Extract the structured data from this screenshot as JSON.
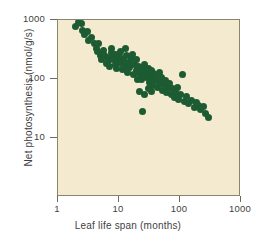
{
  "chart_data": {
    "type": "scatter",
    "title": "",
    "xlabel": "Leaf life span (months)",
    "ylabel": "Net photosynthesis (nmol/g/s)",
    "xscale": "log",
    "yscale": "log",
    "xlim": [
      1,
      1000
    ],
    "ylim": [
      1,
      1000
    ],
    "xticks": [
      1,
      10,
      100,
      1000
    ],
    "xtick_labels": [
      "1",
      "10",
      "100",
      "1000"
    ],
    "yticks": [
      10,
      100,
      1000
    ],
    "ytick_labels": [
      "10",
      "100",
      "1000"
    ],
    "grid": false,
    "legend": null,
    "marker_color": "#1d5b32",
    "plot_background_color": "#f4ead0",
    "frame_color": "#8a8470",
    "series": [
      {
        "name": "Leaf species",
        "points": [
          [
            1.9,
            790
          ],
          [
            2.2,
            900
          ],
          [
            2.45,
            870
          ],
          [
            2.5,
            660
          ],
          [
            2.7,
            560
          ],
          [
            3.0,
            640
          ],
          [
            3.2,
            455
          ],
          [
            3.6,
            500
          ],
          [
            3.9,
            400
          ],
          [
            4.2,
            330
          ],
          [
            4.5,
            290
          ],
          [
            4.6,
            395
          ],
          [
            5.0,
            255
          ],
          [
            5.2,
            215
          ],
          [
            5.6,
            300
          ],
          [
            5.8,
            250
          ],
          [
            6.2,
            180
          ],
          [
            6.4,
            235
          ],
          [
            6.8,
            205
          ],
          [
            7.0,
            160
          ],
          [
            7.4,
            330
          ],
          [
            7.6,
            280
          ],
          [
            7.9,
            250
          ],
          [
            8.2,
            215
          ],
          [
            8.6,
            175
          ],
          [
            8.8,
            265
          ],
          [
            9.2,
            150
          ],
          [
            9.5,
            205
          ],
          [
            10.0,
            240
          ],
          [
            10.5,
            290
          ],
          [
            11.0,
            185
          ],
          [
            11.5,
            145
          ],
          [
            12.0,
            215
          ],
          [
            12.5,
            165
          ],
          [
            13.0,
            330
          ],
          [
            13.5,
            250
          ],
          [
            14.0,
            130
          ],
          [
            14.5,
            190
          ],
          [
            15.0,
            155
          ],
          [
            16.0,
            225
          ],
          [
            17.0,
            118
          ],
          [
            18.0,
            175
          ],
          [
            19.0,
            140
          ],
          [
            20.0,
            100
          ],
          [
            21.0,
            160
          ],
          [
            22.0,
            125
          ],
          [
            23.0,
            98
          ],
          [
            24.0,
            145
          ],
          [
            25.0,
            115
          ],
          [
            26.0,
            175
          ],
          [
            27.0,
            135
          ],
          [
            28.0,
            105
          ],
          [
            29.0,
            130
          ],
          [
            30.0,
            150
          ],
          [
            31.0,
            120
          ],
          [
            32.0,
            88
          ],
          [
            33.0,
            110
          ],
          [
            34.0,
            140
          ],
          [
            35.0,
            100
          ],
          [
            36.0,
            78
          ],
          [
            37.0,
            125
          ],
          [
            38.0,
            95
          ],
          [
            40.0,
            115
          ],
          [
            42.0,
            72
          ],
          [
            44.0,
            92
          ],
          [
            46.0,
            130
          ],
          [
            48.0,
            83
          ],
          [
            50.0,
            105
          ],
          [
            52.0,
            65
          ],
          [
            55.0,
            78
          ],
          [
            58.0,
            95
          ],
          [
            60.0,
            60
          ],
          [
            64.0,
            72
          ],
          [
            68.0,
            85
          ],
          [
            72.0,
            55
          ],
          [
            76.0,
            68
          ],
          [
            80.0,
            48
          ],
          [
            85.0,
            60
          ],
          [
            90.0,
            72
          ],
          [
            95.0,
            45
          ],
          [
            100.0,
            55
          ],
          [
            110.0,
            120
          ],
          [
            120.0,
            42
          ],
          [
            130.0,
            50
          ],
          [
            140.0,
            38
          ],
          [
            155.0,
            44
          ],
          [
            170.0,
            33
          ],
          [
            185.0,
            40
          ],
          [
            200.0,
            35
          ],
          [
            220.0,
            30
          ],
          [
            240.0,
            34
          ],
          [
            265.0,
            26
          ],
          [
            290.0,
            22
          ],
          [
            22.0,
            62
          ],
          [
            26.0,
            55
          ],
          [
            30.0,
            68
          ],
          [
            24.0,
            28
          ],
          [
            34.0,
            62
          ],
          [
            19.0,
            210
          ],
          [
            16.5,
            260
          ]
        ]
      }
    ]
  }
}
